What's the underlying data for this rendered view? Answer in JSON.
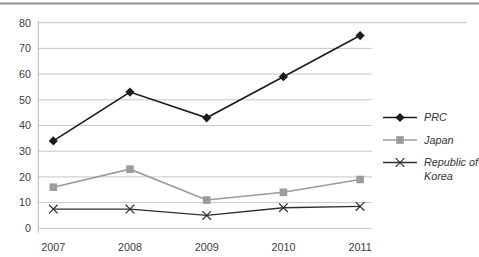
{
  "chart_data": {
    "type": "line",
    "title": "",
    "xlabel": "",
    "ylabel": "",
    "categories": [
      "2007",
      "2008",
      "2009",
      "2010",
      "2011"
    ],
    "series": [
      {
        "name": "PRC",
        "legend_lines": [
          "PRC"
        ],
        "values": [
          34,
          53,
          43,
          59,
          75
        ],
        "color": "#1c1c1c",
        "marker": "diamond",
        "line_width": 1.6
      },
      {
        "name": "Japan",
        "legend_lines": [
          "Japan"
        ],
        "values": [
          16,
          23,
          11,
          14,
          19
        ],
        "color": "#9b9b9b",
        "marker": "square",
        "line_width": 1.6
      },
      {
        "name": "Republic of Korea",
        "legend_lines": [
          "Republic of",
          "Korea"
        ],
        "values": [
          7.5,
          7.5,
          5,
          8,
          8.5
        ],
        "color": "#2f2f2f",
        "marker": "x",
        "line_width": 1.3
      }
    ],
    "ylim": [
      0,
      80
    ],
    "yticks": [
      0,
      10,
      20,
      30,
      40,
      50,
      60,
      70,
      80
    ],
    "grid": true,
    "legend_position": "right"
  },
  "colors": {
    "background": "#ffffff",
    "gridline": "#c6c6c6",
    "axis_line": "#b5b5b5",
    "top_rule": "#8f8f8f",
    "tick_text": "#3c3c3c",
    "legend_text": "#333333"
  }
}
